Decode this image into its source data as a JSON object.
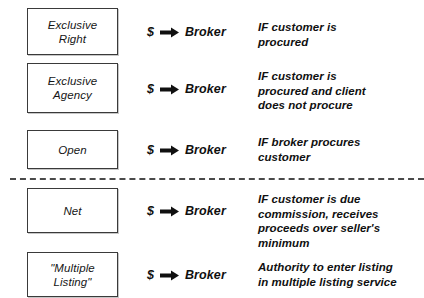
{
  "diagram": {
    "arrow_icon": "right-arrow-icon",
    "divider": {
      "name": "dashed-divider",
      "after_row_index": 2,
      "style": "dashed",
      "color": "#4a4a4a"
    },
    "colors": {
      "box_border": "#3a3a3a",
      "text": "#101010",
      "background": "#ffffff",
      "divider": "#4a4a4a"
    },
    "rows": [
      {
        "box_label": "Exclusive\nRight",
        "payer": "$",
        "payee": "Broker",
        "condition": "IF customer is\nprocured"
      },
      {
        "box_label": "Exclusive\nAgency",
        "payer": "$",
        "payee": "Broker",
        "condition": "IF customer is\nprocured and client\ndoes not procure"
      },
      {
        "box_label": "Open",
        "payer": "$",
        "payee": "Broker",
        "condition": "IF broker procures\ncustomer"
      },
      {
        "box_label": "Net",
        "payer": "$",
        "payee": "Broker",
        "condition": "IF customer is due\ncommission, receives\nproceeds over seller's\nminimum"
      },
      {
        "box_label": "\"Multiple\nListing\"",
        "payer": "$",
        "payee": "Broker",
        "condition": "Authority to enter listing\nin multiple listing service"
      }
    ]
  }
}
